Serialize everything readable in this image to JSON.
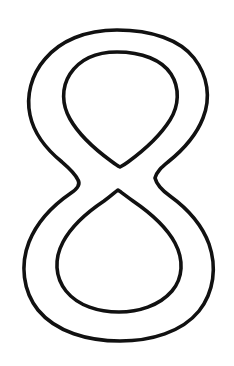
{
  "page": {
    "background_color": "#ffffff",
    "width": 234,
    "height": 366,
    "kind": "line-art-coloring-page"
  },
  "artwork": {
    "name": "digit-eight-outline",
    "subject": "8",
    "description": "Bold outline drawing of the numeral eight, two closed loops with hollow counters",
    "style": "outline",
    "stroke_color": "#111111",
    "fill_color": "#ffffff",
    "stroke_width": 3.6,
    "paths": {
      "outer_outline": "M 117 30 C 152 30 180 40 194 58 C 208 76 211 98 203 118 C 196 136 183 150 168 162 C 162 167 157 171 155 178 C 157 186 163 191 170 196 C 188 209 202 225 209 244 C 217 267 214 292 199 311 C 182 332 151 341 120 341 C 88 341 56 332 38 310 C 23 291 20 265 29 242 C 37 222 52 206 71 193 C 77 189 81 185 78 180 C 75 173 69 168 62 162 C 46 149 34 134 30 115 C 26 96 31 75 45 59 C 60 41 85 30 117 30 Z",
      "inner_counter_top": "M 117 52 C 142 52 162 60 171 74 C 180 88 179 106 170 120 C 160 136 143 151 128 162 C 124 165 122 166 120 167 C 118 166 115 164 111 161 C 96 150 79 135 70 119 C 62 105 61 88 70 74 C 80 59 96 52 117 52 Z",
      "inner_counter_bottom": "M 118 190 C 121 192 126 196 133 201 C 152 214 167 228 175 243 C 184 260 183 278 172 291 C 159 306 138 312 119 312 C 99 312 78 306 66 291 C 55 277 54 259 63 242 C 71 227 86 213 104 201 C 111 196 115 192 118 190 Z"
    },
    "geometry": {
      "outer_top_apex_y": 30,
      "outer_bottom_y": 341,
      "top_loop_outer_left_x": 30,
      "top_loop_outer_right_x": 204,
      "bottom_loop_outer_left_x": 23,
      "bottom_loop_outer_right_x": 212,
      "waist_left_vertex": [
        78,
        180
      ],
      "waist_right_vertex": [
        155,
        178
      ],
      "inner_top_counter_top_y": 52,
      "inner_top_counter_bottom_vertex": [
        120,
        167
      ],
      "inner_bottom_counter_top_vertex": [
        118,
        190
      ],
      "inner_bottom_counter_bottom_y": 312
    }
  }
}
